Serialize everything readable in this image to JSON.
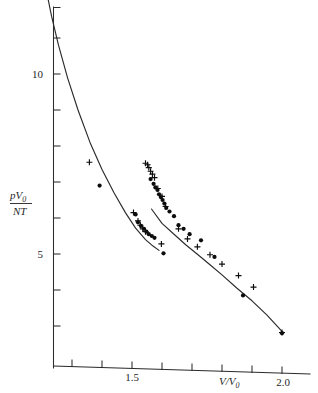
{
  "figure": {
    "background_color": "#ffffff",
    "ink_color": "#1a1a1a"
  },
  "chart_data": {
    "type": "scatter",
    "title": "",
    "subtitle": "",
    "xlabel": "V/V0",
    "xlabel_parts": {
      "numerator": "V",
      "denominator": "V",
      "denominator_sub": "0"
    },
    "ylabel": "pV0 / NT",
    "ylabel_parts": {
      "num_main": "pV",
      "num_sub": "0",
      "den_script": "N",
      "den_main": "T"
    },
    "xlim": [
      1.2,
      2.05
    ],
    "ylim": [
      0.0,
      12.6
    ],
    "grid": false,
    "legend": null,
    "x_ticks": [
      1.3,
      1.4,
      1.5,
      1.6,
      1.7,
      1.8,
      1.9,
      2.0
    ],
    "x_tick_labels": [
      "",
      "",
      "1.5",
      "",
      "",
      "",
      "",
      "2.0"
    ],
    "y_ticks": [
      2,
      3,
      4,
      5,
      6,
      7,
      8,
      9,
      10,
      11,
      12
    ],
    "y_tick_labels": [
      "",
      "",
      "",
      "5",
      "",
      "",
      "",
      "",
      "10",
      "",
      ""
    ],
    "x_axis_tilt_note": "baseline drawn with slight downward tilt to the right",
    "series": [
      {
        "name": "fitted-curve-upper",
        "type": "line",
        "marker": "none",
        "x": [
          1.215,
          1.232,
          1.255,
          1.285,
          1.32,
          1.36,
          1.4,
          1.44,
          1.478,
          1.512,
          1.545,
          1.57,
          1.59
        ],
        "y": [
          12.3,
          11.6,
          10.8,
          9.9,
          9.0,
          8.1,
          7.35,
          6.7,
          6.15,
          5.72,
          5.4,
          5.22,
          5.1
        ]
      },
      {
        "name": "fitted-curve-lower",
        "type": "line",
        "marker": "none",
        "x": [
          1.565,
          1.6,
          1.64,
          1.68,
          1.72,
          1.76,
          1.8,
          1.85,
          1.9,
          1.95,
          2.0
        ],
        "y": [
          6.25,
          5.85,
          5.55,
          5.25,
          4.98,
          4.7,
          4.42,
          4.05,
          3.7,
          3.3,
          2.85
        ]
      },
      {
        "name": "crosses-branch-A",
        "type": "scatter",
        "marker": "plus",
        "x": [
          1.222,
          1.358,
          1.505,
          1.52,
          1.528,
          1.536,
          1.545
        ],
        "y": [
          12.18,
          7.55,
          6.15,
          5.92,
          5.8,
          5.7,
          5.62
        ]
      },
      {
        "name": "dots-branch-A",
        "type": "scatter",
        "marker": "dot",
        "x": [
          1.392,
          1.512,
          1.52,
          1.53,
          1.54,
          1.548,
          1.556,
          1.566,
          1.575
        ],
        "y": [
          6.9,
          6.1,
          5.88,
          5.78,
          5.7,
          5.62,
          5.55,
          5.5,
          5.45
        ]
      },
      {
        "name": "crosses-branch-B",
        "type": "scatter",
        "marker": "plus",
        "x": [
          1.545,
          1.552,
          1.556,
          1.562,
          1.568,
          1.575,
          1.586,
          1.6,
          1.612,
          1.655,
          1.685,
          1.718,
          1.76,
          1.8,
          1.855,
          1.905,
          2.0
        ],
        "y": [
          7.52,
          7.48,
          7.4,
          7.3,
          7.22,
          7.12,
          6.82,
          6.6,
          6.32,
          5.7,
          5.42,
          5.2,
          4.98,
          4.72,
          4.4,
          4.08,
          2.82
        ]
      },
      {
        "name": "dots-branch-B",
        "type": "scatter",
        "marker": "dot",
        "x": [
          1.562,
          1.572,
          1.578,
          1.585,
          1.59,
          1.596,
          1.602,
          1.608,
          1.614,
          1.625,
          1.64,
          1.655,
          1.672,
          1.692,
          1.73,
          1.775,
          1.87,
          2.0
        ],
        "y": [
          7.08,
          6.95,
          6.85,
          6.78,
          6.66,
          6.58,
          6.5,
          6.4,
          6.28,
          6.18,
          6.05,
          5.8,
          5.7,
          5.55,
          5.38,
          4.92,
          3.85,
          2.8
        ]
      },
      {
        "name": "outlier-crosses",
        "type": "scatter",
        "marker": "plus",
        "x": [
          1.598
        ],
        "y": [
          5.28
        ]
      },
      {
        "name": "outlier-dots",
        "type": "scatter",
        "marker": "dot",
        "x": [
          1.605
        ],
        "y": [
          5.02
        ]
      },
      {
        "name": "triangle-point",
        "type": "scatter",
        "marker": "triangle",
        "x": [
          1.222
        ],
        "y": [
          12.52
        ]
      }
    ]
  }
}
